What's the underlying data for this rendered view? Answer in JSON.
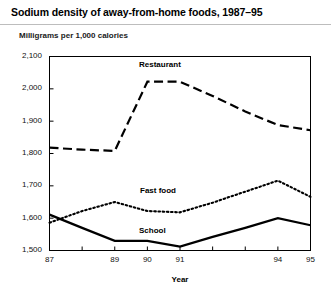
{
  "header": {
    "title": "Sodium density of away-from-home foods, 1987–95",
    "subtitle": "Milligrams per 1,000 calories"
  },
  "chart_data": {
    "type": "line",
    "title": "Sodium density of away-from-home foods, 1987–95",
    "subtitle": "Milligrams per 1,000 calories",
    "xlabel": "Year",
    "ylabel": "",
    "ylim": [
      1500,
      2100
    ],
    "ytick_values": [
      1500,
      1600,
      1700,
      1800,
      1900,
      2000,
      2100
    ],
    "ytick_labels": [
      "1,500",
      "1,600",
      "1,700",
      "1,800",
      "1,900",
      "2,000",
      "2,100"
    ],
    "x": [
      1987,
      1988,
      1989,
      1990,
      1991,
      1992,
      1993,
      1994,
      1995
    ],
    "xtick_labels": [
      "87",
      "",
      "89",
      "90",
      "91",
      "",
      "",
      "94",
      "95"
    ],
    "grid": false,
    "legend_position": "inline-labels",
    "series": [
      {
        "name": "Restaurant",
        "style": "dashed",
        "color": "#000000",
        "values": [
          1818,
          1812,
          1808,
          2022,
          2022,
          1978,
          1930,
          1888,
          1872
        ]
      },
      {
        "name": "Fast food",
        "style": "dotted",
        "color": "#000000",
        "values": [
          1586,
          1622,
          1650,
          1622,
          1618,
          1648,
          1682,
          1716,
          1666
        ]
      },
      {
        "name": "School",
        "style": "solid",
        "color": "#000000",
        "values": [
          1611,
          1570,
          1530,
          1530,
          1512,
          1542,
          1570,
          1600,
          1578
        ]
      }
    ]
  }
}
